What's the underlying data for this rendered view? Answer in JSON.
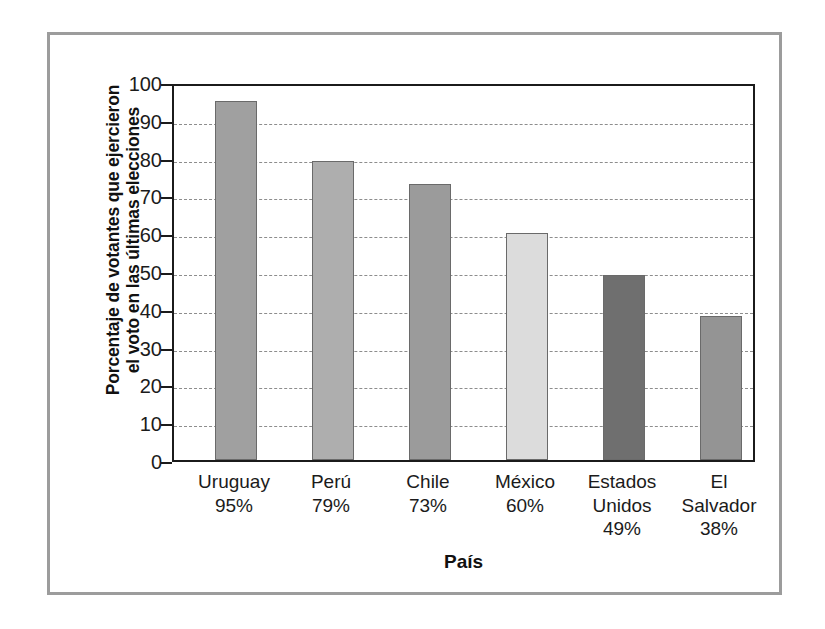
{
  "chart_data": {
    "type": "bar",
    "title": "",
    "xlabel": "País",
    "ylabel_lines": [
      "Porcentaje de votantes que ejercieron",
      "el voto en las últimas elecciones"
    ],
    "ylabel": "Porcentaje de votantes que ejercieron el voto en las últimas elecciones",
    "categories": [
      "Uruguay",
      "Perú",
      "Chile",
      "México",
      "Estados Unidos",
      "El Salvador"
    ],
    "category_labels": [
      "Uruguay",
      "Perú",
      "Chile",
      "México",
      "Estados\nUnidos",
      "El\nSalvador"
    ],
    "values": [
      95,
      79,
      73,
      60,
      49,
      38
    ],
    "value_labels": [
      "95%",
      "79%",
      "73%",
      "60%",
      "49%",
      "38%"
    ],
    "bar_colors": [
      "#a0a0a0",
      "#aeaeae",
      "#9b9b9b",
      "#dcdcdc",
      "#6f6f6f",
      "#949494"
    ],
    "ylim": [
      0,
      100
    ],
    "ytick_values": [
      100,
      90,
      80,
      70,
      60,
      50,
      40,
      30,
      20,
      10,
      0
    ],
    "ytick_labels": [
      "100",
      "90",
      "80",
      "70",
      "60",
      "50",
      "40",
      "30",
      "20",
      "10",
      "0"
    ],
    "grid": true,
    "grid_style": "dashed-horizontal",
    "legend": "none",
    "frame_color": "#9c9c9c",
    "axis_color": "#1b1b1b",
    "grid_color": "#8d8d8d"
  }
}
